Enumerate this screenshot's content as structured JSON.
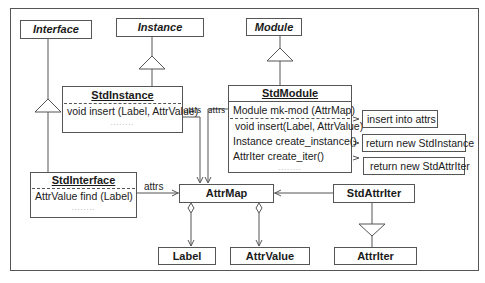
{
  "diagram": {
    "type": "UML class diagram",
    "abstract_classes": {
      "interface": "Interface",
      "instance": "Instance",
      "module": "Module"
    },
    "std_instance": {
      "name": "StdInstance",
      "operations": [
        "void insert (Label, AttrValue)"
      ],
      "ellipsis": "........"
    },
    "std_module": {
      "name": "StdModule",
      "attributes": [
        "Module mk-mod (AttrMap)"
      ],
      "operations": [
        "void insert(Label, AttrValue)",
        "Instance create_instance()",
        "AttrIter create_iter()"
      ],
      "ellipsis": "........"
    },
    "std_interface": {
      "name": "StdInterface",
      "operations": [
        "AttrValue find (Label)"
      ],
      "ellipsis": "........"
    },
    "attr_map": {
      "name": "AttrMap"
    },
    "std_attr_iter": {
      "name": "StdAttrIter"
    },
    "label": {
      "name": "Label"
    },
    "attr_value": {
      "name": "AttrValue"
    },
    "attr_iter": {
      "name": "AttrIter"
    },
    "notes": {
      "insert": "insert into attrs",
      "create_instance": "return new StdInstance",
      "create_iter": "return new StdAttrIter"
    },
    "association_labels": {
      "instance_attrs": "attrs",
      "module_attrs": "attrs",
      "interface_attrs": "attrs"
    }
  }
}
